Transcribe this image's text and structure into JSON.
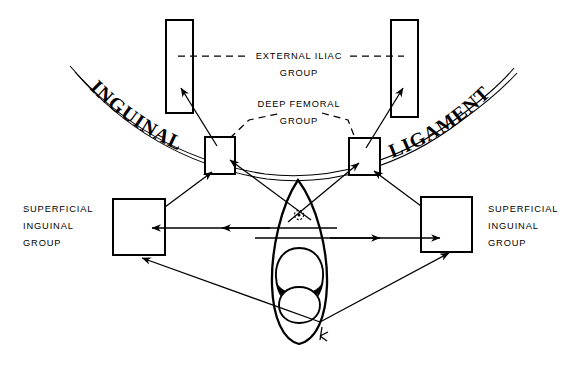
{
  "diagram": {
    "line_color": "#000000",
    "background_color": "#ffffff",
    "labels": {
      "external_iliac_line1": "EXTERNAL ILIAC",
      "external_iliac_line2": "GROUP",
      "deep_femoral_line1": "DEEP FEMORAL",
      "deep_femoral_line2": "GROUP",
      "superficial_left_line1": "SUPERFICIAL",
      "superficial_left_line2": "INGUINAL",
      "superficial_left_line3": "GROUP",
      "superficial_right_line1": "SUPERFICIAL",
      "superficial_right_line2": "INGUINAL",
      "superficial_right_line3": "GROUP",
      "ligament_left": "INGUINAL",
      "ligament_right": "LIGAMENT"
    },
    "nodes": [
      {
        "name": "external-iliac-left",
        "x": 166,
        "y": 20,
        "w": 27,
        "h": 93
      },
      {
        "name": "external-iliac-right",
        "x": 391,
        "y": 20,
        "w": 27,
        "h": 97
      },
      {
        "name": "deep-femoral-left",
        "x": 205,
        "y": 137,
        "w": 30,
        "h": 37
      },
      {
        "name": "deep-femoral-right",
        "x": 349,
        "y": 138,
        "w": 31,
        "h": 37
      },
      {
        "name": "superficial-inguinal-left",
        "x": 113,
        "y": 199,
        "w": 52,
        "h": 56
      },
      {
        "name": "superficial-inguinal-right",
        "x": 421,
        "y": 197,
        "w": 51,
        "h": 55
      }
    ],
    "icons": [
      "arrow-head-icon",
      "dashed-leader-icon",
      "ligament-band-icon",
      "penis-outline-icon",
      "glans-icon",
      "urethral-meatus-icon",
      "orientation-marker-icon"
    ]
  }
}
